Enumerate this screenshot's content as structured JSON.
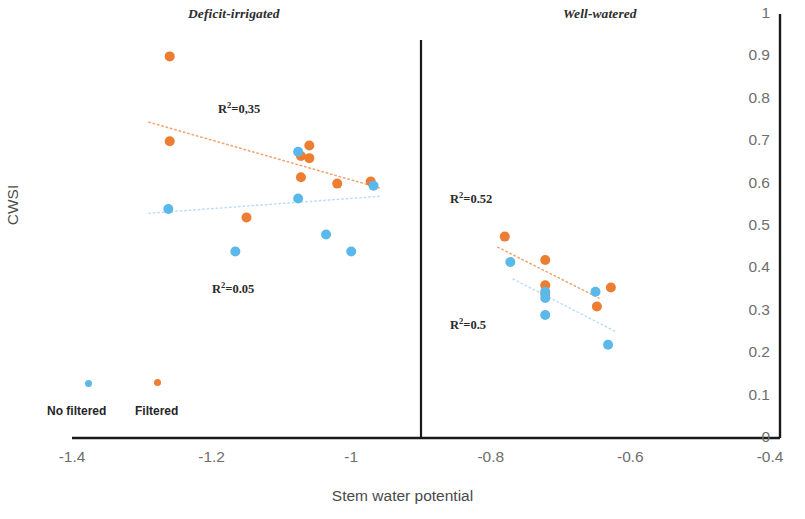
{
  "figure": {
    "axis_title_x": "Stem water potential",
    "axis_title_y": "CWSI",
    "panels": [
      {
        "id": "deficit",
        "title": "Deficit-irrigated"
      },
      {
        "id": "well",
        "title": "Well-watered"
      }
    ],
    "colors": {
      "filtered": "#ed7d31",
      "no_filtered": "#5bb8ea",
      "axis": "#1a1a1a",
      "tick_text": "#6e6e6e",
      "trend_filtered": "#f0a272",
      "trend_no_filtered": "#bcdff4"
    }
  },
  "legend": {
    "items": [
      {
        "label": "No filtered",
        "color": "#5bb8ea",
        "key": "no_filtered"
      },
      {
        "label": "Filtered",
        "color": "#ed7d31",
        "key": "filtered"
      }
    ]
  },
  "annotations": [
    {
      "id": "r2-deficit-filtered",
      "text": "R²=0,35",
      "base": "R",
      "sup": "2",
      "rest": "=0,35",
      "x": 218,
      "y": 100
    },
    {
      "id": "r2-deficit-nofiltered",
      "text": "R²=0.05",
      "base": "R",
      "sup": "2",
      "rest": "=0.05",
      "x": 212,
      "y": 280
    },
    {
      "id": "r2-well-filtered",
      "text": "R²=0.52",
      "base": "R",
      "sup": "2",
      "rest": "=0.52",
      "x": 450,
      "y": 190
    },
    {
      "id": "r2-well-nofiltered",
      "text": "R²=0.5",
      "base": "R",
      "sup": "2",
      "rest": "=0.5",
      "x": 450,
      "y": 316
    }
  ],
  "chart_data": {
    "type": "scatter",
    "title": "",
    "xlabel": "Stem water potential",
    "ylabel": "CWSI",
    "xlim": [
      -1.4,
      -0.4
    ],
    "ylim": [
      0,
      1
    ],
    "xticks": [
      -1.4,
      -1.2,
      -1,
      -0.8,
      -0.6,
      -0.4
    ],
    "xtick_labels": [
      "-1.4",
      "-1.2",
      "-1",
      "-0.8",
      "-0.6",
      "-0.4"
    ],
    "yticks": [
      0,
      0.1,
      0.2,
      0.3,
      0.4,
      0.5,
      0.6,
      0.7,
      0.8,
      0.9,
      1
    ],
    "ytick_labels": [
      "0",
      "0.1",
      "0.2",
      "0.3",
      "0.4",
      "0.5",
      "0.6",
      "0.7",
      "0.8",
      "0.9",
      "1"
    ],
    "grid": false,
    "legend_position": "bottom-left",
    "y_axis_side": "right",
    "panel_divider_x": -0.9,
    "panels": [
      {
        "name": "Deficit-irrigated",
        "series": [
          {
            "name": "Filtered",
            "color": "#ed7d31",
            "points": [
              {
                "x": -1.26,
                "y": 0.9
              },
              {
                "x": -1.26,
                "y": 0.7
              },
              {
                "x": -1.15,
                "y": 0.52
              },
              {
                "x": -1.072,
                "y": 0.665
              },
              {
                "x": -1.06,
                "y": 0.69
              },
              {
                "x": -1.06,
                "y": 0.66
              },
              {
                "x": -1.072,
                "y": 0.615
              },
              {
                "x": -1.02,
                "y": 0.6
              },
              {
                "x": -0.972,
                "y": 0.605
              }
            ]
          },
          {
            "name": "No filtered",
            "color": "#5bb8ea",
            "points": [
              {
                "x": -1.262,
                "y": 0.54
              },
              {
                "x": -1.166,
                "y": 0.44
              },
              {
                "x": -1.076,
                "y": 0.675
              },
              {
                "x": -1.076,
                "y": 0.565
              },
              {
                "x": -1.036,
                "y": 0.48
              },
              {
                "x": -1.0,
                "y": 0.44
              },
              {
                "x": -0.968,
                "y": 0.595
              }
            ]
          }
        ],
        "trendlines": [
          {
            "name": "Filtered",
            "color": "#f0a272",
            "x1": -1.29,
            "y1": 0.745,
            "x2": -0.96,
            "y2": 0.59,
            "r2": "0,35"
          },
          {
            "name": "No filtered",
            "color": "#bcdff4",
            "x1": -1.29,
            "y1": 0.53,
            "x2": -0.96,
            "y2": 0.57,
            "r2": "0.05"
          }
        ]
      },
      {
        "name": "Well-watered",
        "series": [
          {
            "name": "Filtered",
            "color": "#ed7d31",
            "points": [
              {
                "x": -0.78,
                "y": 0.475
              },
              {
                "x": -0.722,
                "y": 0.42
              },
              {
                "x": -0.722,
                "y": 0.36
              },
              {
                "x": -0.722,
                "y": 0.34
              },
              {
                "x": -0.648,
                "y": 0.31
              },
              {
                "x": -0.628,
                "y": 0.355
              }
            ]
          },
          {
            "name": "No filtered",
            "color": "#5bb8ea",
            "points": [
              {
                "x": -0.772,
                "y": 0.415
              },
              {
                "x": -0.722,
                "y": 0.345
              },
              {
                "x": -0.722,
                "y": 0.33
              },
              {
                "x": -0.722,
                "y": 0.29
              },
              {
                "x": -0.65,
                "y": 0.345
              },
              {
                "x": -0.632,
                "y": 0.22
              }
            ]
          }
        ],
        "trendlines": [
          {
            "name": "Filtered",
            "color": "#f0a272",
            "x1": -0.79,
            "y1": 0.45,
            "x2": -0.645,
            "y2": 0.33,
            "r2": "0.52"
          },
          {
            "name": "No filtered",
            "color": "#bcdff4",
            "x1": -0.768,
            "y1": 0.375,
            "x2": -0.62,
            "y2": 0.25,
            "r2": "0.5"
          }
        ]
      }
    ]
  }
}
